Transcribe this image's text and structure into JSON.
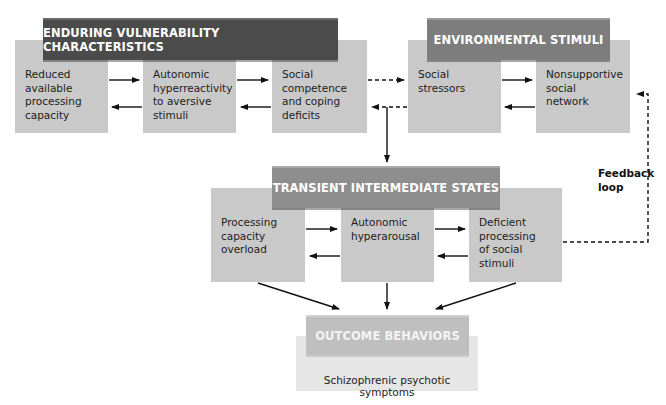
{
  "diagram": {
    "sections": {
      "enduring": {
        "title": "ENDURING VULNERABILITY CHARACTERISTICS",
        "boxes": [
          "Reduced\navailable\nprocessing\ncapacity",
          "Autonomic\nhyperreactivity\nto aversive\nstimuli",
          "Social\ncompetence\nand coping\ndeficits"
        ]
      },
      "environmental": {
        "title": "ENVIRONMENTAL STIMULI",
        "boxes": [
          "Social\nstressors",
          "Nonsupportive\nsocial\nnetwork"
        ]
      },
      "transient": {
        "title": "TRANSIENT INTERMEDIATE STATES",
        "boxes": [
          "Processing\ncapacity\noverload",
          "Autonomic\nhyperarousal",
          "Deficient\nprocessing\nof social\nstimuli"
        ]
      },
      "outcome": {
        "title": "OUTCOME BEHAVIORS",
        "text": "Schizophrenic psychotic symptoms"
      }
    },
    "annotations": {
      "feedback_loop": "Feedback\nloop"
    },
    "colors": {
      "box_fill": "#c9c9c9",
      "header_enduring": "#4b4b4b",
      "header_environmental": "#7d7d7d",
      "header_transient": "#8e8e8e",
      "header_outcome": "#bfbfbf",
      "outcome_fill": "#e6e6e6",
      "arrow": "#111111"
    }
  }
}
